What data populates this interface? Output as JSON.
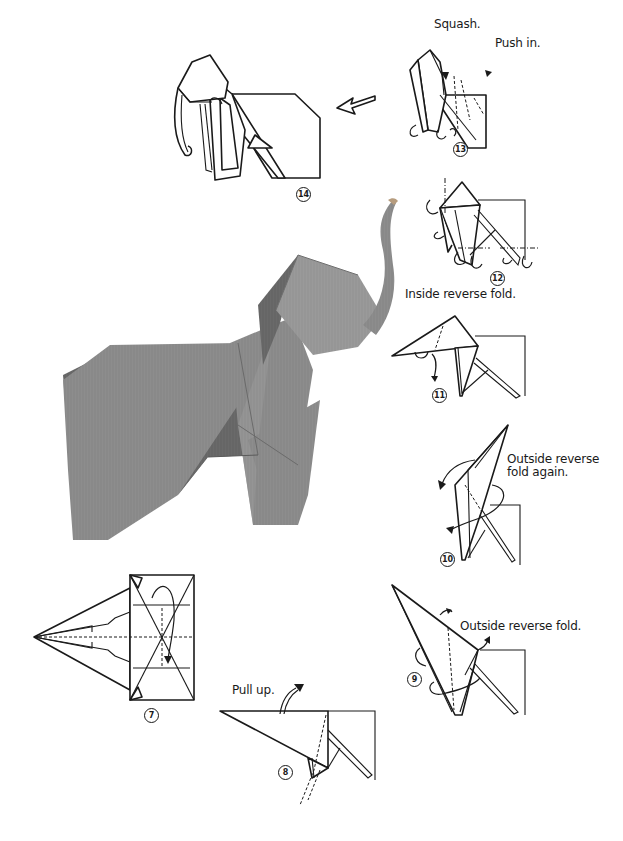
{
  "page": {
    "background": "#ffffff",
    "ink_color": "#1a1a1a",
    "photo_paper_color": "#8a8a8a"
  },
  "steps": [
    {
      "number": "7",
      "symbol": "⑦",
      "instructions": []
    },
    {
      "number": "8",
      "symbol": "⑧",
      "instructions": [
        "Pull up."
      ]
    },
    {
      "number": "9",
      "symbol": "⑨",
      "instructions": [
        "Outside reverse fold."
      ]
    },
    {
      "number": "10",
      "symbol": "⑩",
      "instructions": [
        "Outside reverse",
        "fold again."
      ]
    },
    {
      "number": "11",
      "symbol": "⑪",
      "instructions": [
        "Inside reverse fold."
      ]
    },
    {
      "number": "12",
      "symbol": "⑫",
      "instructions": []
    },
    {
      "number": "13",
      "symbol": "⑬",
      "instructions": [
        "Squash.",
        "Push in."
      ]
    },
    {
      "number": "14",
      "symbol": "⑭",
      "instructions": []
    }
  ],
  "labels": {
    "step7": "7",
    "step8": "8",
    "step8_text": "Pull up.",
    "step9": "9",
    "step9_text": "Outside reverse fold.",
    "step10": "10",
    "step10_text_line1": "Outside reverse",
    "step10_text_line2": "fold again.",
    "step11": "11",
    "step11_text": "Inside reverse fold.",
    "step12": "12",
    "step13": "13",
    "step13_text_squash": "Squash.",
    "step13_text_push": "Push in.",
    "step14": "14"
  },
  "icons": {
    "next_arrow": "hollow-arrow-left",
    "fold_arrows": "curved-arrow",
    "valley_fold": "dashed-line",
    "mountain_fold": "dash-dot-line"
  },
  "photo": {
    "description": "Finished origami elephant, gray textured paper, trunk raised"
  }
}
